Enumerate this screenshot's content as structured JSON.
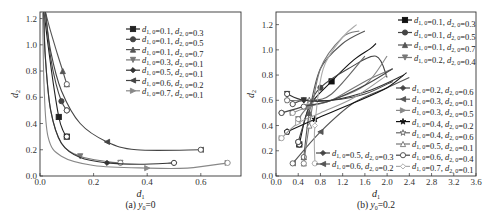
{
  "chart_data": [
    {
      "type": "line",
      "caption": "(a) y0=0",
      "xlabel": "d1",
      "ylabel": "d2",
      "xlim": [
        0,
        0.75
      ],
      "ylim": [
        0,
        1.25
      ],
      "xticks": [
        "0.0",
        "0.2",
        "0.4",
        "0.6"
      ],
      "yticks": [
        "0.0",
        "0.2",
        "0.4",
        "0.6",
        "0.8",
        "1.0",
        "1.2"
      ],
      "grid": false,
      "legend_position": "upper right",
      "series": [
        {
          "name": "d1,0=0.1, d2,0=0.3",
          "color": "#222222",
          "marker": "square",
          "x": [
            0.1,
            0.085,
            0.07,
            0.05,
            0.03,
            0.015
          ],
          "y": [
            0.3,
            0.35,
            0.45,
            0.7,
            1.0,
            1.25
          ]
        },
        {
          "name": "d1,0=0.1, d2,0=0.5",
          "color": "#444444",
          "marker": "circle",
          "x": [
            0.1,
            0.08,
            0.06,
            0.04,
            0.02
          ],
          "y": [
            0.5,
            0.57,
            0.7,
            0.9,
            1.25
          ]
        },
        {
          "name": "d1,0=0.1, d2,0=0.7",
          "color": "#555555",
          "marker": "triangle-up",
          "x": [
            0.1,
            0.085,
            0.065,
            0.04,
            0.02
          ],
          "y": [
            0.7,
            0.8,
            0.93,
            1.1,
            1.25
          ]
        },
        {
          "name": "d1,0=0.3, d2,0=0.1",
          "color": "#777777",
          "marker": "triangle-down",
          "x": [
            0.3,
            0.25,
            0.15,
            0.08,
            0.04,
            0.02,
            0.015
          ],
          "y": [
            0.1,
            0.11,
            0.15,
            0.25,
            0.5,
            0.9,
            1.25
          ]
        },
        {
          "name": "d1,0=0.5, d2,0=0.1",
          "color": "#333333",
          "marker": "diamond",
          "x": [
            0.5,
            0.37,
            0.25,
            0.15,
            0.08,
            0.04,
            0.02,
            0.013
          ],
          "y": [
            0.1,
            0.09,
            0.1,
            0.14,
            0.25,
            0.5,
            0.9,
            1.25
          ]
        },
        {
          "name": "d1,0=0.6, d2,0=0.2",
          "color": "#444444",
          "marker": "left-triangle",
          "x": [
            0.6,
            0.36,
            0.25,
            0.15,
            0.08,
            0.04,
            0.02
          ],
          "y": [
            0.2,
            0.2,
            0.26,
            0.4,
            0.65,
            0.95,
            1.25
          ]
        },
        {
          "name": "d1,0=0.7, d2,0=0.1",
          "color": "#888888",
          "marker": "right-triangle",
          "x": [
            0.7,
            0.55,
            0.4,
            0.2,
            0.08,
            0.03,
            0.015,
            0.01
          ],
          "y": [
            0.1,
            0.06,
            0.06,
            0.08,
            0.15,
            0.3,
            0.7,
            1.25
          ]
        }
      ]
    },
    {
      "type": "line",
      "caption": "(b) y0=0.2",
      "xlabel": "d1",
      "ylabel": "d2",
      "xlim": [
        0,
        3.6
      ],
      "ylim": [
        0,
        1.3
      ],
      "xticks": [
        "0.0",
        "0.4",
        "0.8",
        "1.2",
        "1.6",
        "2.0",
        "2.4",
        "2.8",
        "3.2",
        "3.6"
      ],
      "yticks": [
        "0.0",
        "0.2",
        "0.4",
        "0.6",
        "0.8",
        "1.0",
        "1.2"
      ],
      "grid": false,
      "legend_position": "right",
      "series": [
        {
          "name": "d1,0=0.1, d2,0=0.3",
          "color": "#111111",
          "marker": "square",
          "x": [
            0.42,
            0.6,
            1.0,
            1.4,
            1.7,
            1.8
          ],
          "y": [
            0.25,
            0.55,
            0.75,
            0.92,
            1.01,
            1.05
          ]
        },
        {
          "name": "d1,0=0.1, d2,0=0.5",
          "color": "#444444",
          "marker": "circle",
          "x": [
            0.4,
            0.6,
            0.8,
            1.3,
            1.8,
            2.0
          ],
          "y": [
            0.27,
            0.55,
            0.7,
            0.85,
            0.95,
            0.78
          ]
        },
        {
          "name": "d1,0=0.1, d2,0=0.7",
          "color": "#555555",
          "marker": "triangle-up",
          "x": [
            0.5,
            0.6,
            0.8,
            1.2,
            1.6
          ],
          "y": [
            0.15,
            0.5,
            0.85,
            1.05,
            1.15
          ]
        },
        {
          "name": "d1,0=0.2, d2,0=0.4",
          "color": "#777777",
          "marker": "triangle-down",
          "x": [
            0.4,
            0.6,
            1.0,
            1.6,
            2.1
          ],
          "y": [
            0.45,
            0.55,
            0.6,
            0.75,
            0.85
          ]
        },
        {
          "name": "d1,0=0.2, d2,0=0.6",
          "color": "#444444",
          "marker": "diamond",
          "x": [
            0.3,
            0.5,
            1.0,
            1.6,
            2.1
          ],
          "y": [
            0.57,
            0.6,
            0.6,
            0.65,
            0.75
          ]
        },
        {
          "name": "d1,0=0.3, d2,0=0.1",
          "color": "#555555",
          "marker": "left-triangle",
          "x": [
            0.3,
            0.8,
            1.4,
            2.0,
            2.4
          ],
          "y": [
            0.1,
            0.35,
            0.58,
            0.7,
            0.78
          ]
        },
        {
          "name": "d1,0=0.3, d2,0=0.5",
          "color": "#888888",
          "marker": "right-triangle",
          "x": [
            0.3,
            0.6,
            1.0,
            1.6,
            2.0
          ],
          "y": [
            0.5,
            0.55,
            0.6,
            0.72,
            0.95
          ]
        },
        {
          "name": "d1,0=0.4, d2,0=0.2",
          "color": "#111111",
          "marker": "star",
          "x": [
            0.2,
            0.7,
            1.4,
            2.0,
            2.35
          ],
          "y": [
            0.35,
            0.45,
            0.58,
            0.7,
            0.82
          ]
        },
        {
          "name": "d1,0=0.4, d2,0=0.6",
          "color": "#666666",
          "marker": "open-star",
          "x": [
            0.2,
            0.6,
            1.0,
            1.6
          ],
          "y": [
            0.6,
            0.6,
            0.65,
            0.95
          ]
        },
        {
          "name": "d1,0=0.5, d2,0=0.1",
          "color": "#777777",
          "marker": "open-triangle",
          "x": [
            0.5,
            0.6,
            0.8,
            1.2,
            1.5
          ],
          "y": [
            0.1,
            0.4,
            0.85,
            1.1,
            1.15
          ]
        },
        {
          "name": "d1,0=0.6, d2,0=0.4",
          "color": "#444444",
          "marker": "open-circle",
          "x": [
            0.1,
            0.5,
            1.0,
            1.6,
            2.1
          ],
          "y": [
            0.5,
            0.55,
            0.6,
            0.72,
            0.85
          ]
        },
        {
          "name": "d1,0=0.7, d2,0=0.1",
          "color": "#aaaaaa",
          "marker": "open-diamond",
          "x": [
            0.7,
            0.7,
            0.85,
            1.2,
            1.45
          ],
          "y": [
            0.1,
            0.4,
            0.85,
            1.1,
            1.2
          ]
        },
        {
          "name": "d1,0=0.5, d2,0=0.3",
          "color": "#333333",
          "marker": "triangle-down",
          "x": [
            0.2,
            0.5,
            1.0,
            1.7,
            2.3
          ],
          "y": [
            0.65,
            0.6,
            0.6,
            0.68,
            0.8
          ]
        },
        {
          "name": "d1,0=0.6, d2,0=0.2",
          "color": "#999999",
          "marker": "open-right-triangle",
          "x": [
            0.1,
            0.4,
            0.8,
            1.4,
            2.0
          ],
          "y": [
            0.3,
            0.42,
            0.5,
            0.62,
            0.8
          ]
        }
      ]
    }
  ],
  "legend_a": [
    {
      "d1": "0.1",
      "d2": "0.3"
    },
    {
      "d1": "0.1",
      "d2": "0.5"
    },
    {
      "d1": "0.1",
      "d2": "0.7"
    },
    {
      "d1": "0.3",
      "d2": "0.1"
    },
    {
      "d1": "0.5",
      "d2": "0.1"
    },
    {
      "d1": "0.6",
      "d2": "0.2"
    },
    {
      "d1": "0.7",
      "d2": "0.1"
    }
  ],
  "legend_b": [
    {
      "d1": "0.1",
      "d2": "0.3"
    },
    {
      "d1": "0.1",
      "d2": "0.5"
    },
    {
      "d1": "0.1",
      "d2": "0.7"
    },
    {
      "d1": "0.2",
      "d2": "0.4"
    },
    {
      "d1": "0.2",
      "d2": "0.6"
    },
    {
      "d1": "0.3",
      "d2": "0.1"
    },
    {
      "d1": "0.3",
      "d2": "0.5"
    },
    {
      "d1": "0.4",
      "d2": "0.2"
    },
    {
      "d1": "0.4",
      "d2": "0.6"
    },
    {
      "d1": "0.5",
      "d2": "0.1"
    },
    {
      "d1": "0.6",
      "d2": "0.4"
    },
    {
      "d1": "0.7",
      "d2": "0.1"
    }
  ],
  "legend_b_inset": [
    {
      "d1": "0.5",
      "d2": "0.3"
    },
    {
      "d1": "0.6",
      "d2": "0.2"
    }
  ],
  "captions": {
    "a": "(a) y0=0",
    "b": "(b) y0=0.2"
  }
}
